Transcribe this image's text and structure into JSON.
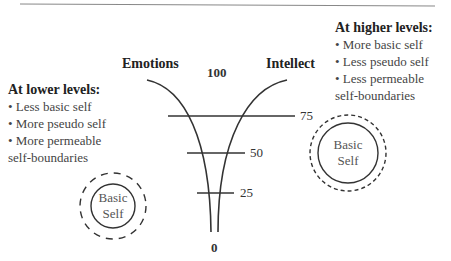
{
  "diagram": {
    "left_pole_label": "Emotions",
    "right_pole_label": "Intellect",
    "scale": {
      "top": "100",
      "ticks": [
        "75",
        "50",
        "25"
      ],
      "bottom": "0"
    },
    "lower_levels": {
      "heading": "At lower levels:",
      "items": [
        "• Less basic self",
        "• More pseudo self",
        "• More permeable",
        "self-boundaries"
      ]
    },
    "higher_levels": {
      "heading": "At higher levels:",
      "items": [
        "• More basic self",
        "• Less pseudo self",
        "• Less permeable",
        "self-boundaries"
      ]
    },
    "left_circle": {
      "line1": "Basic",
      "line2": "Self"
    },
    "right_circle": {
      "line1": "Basic",
      "line2": "Self"
    },
    "colors": {
      "line": "#333333",
      "rule": "#888888"
    }
  }
}
